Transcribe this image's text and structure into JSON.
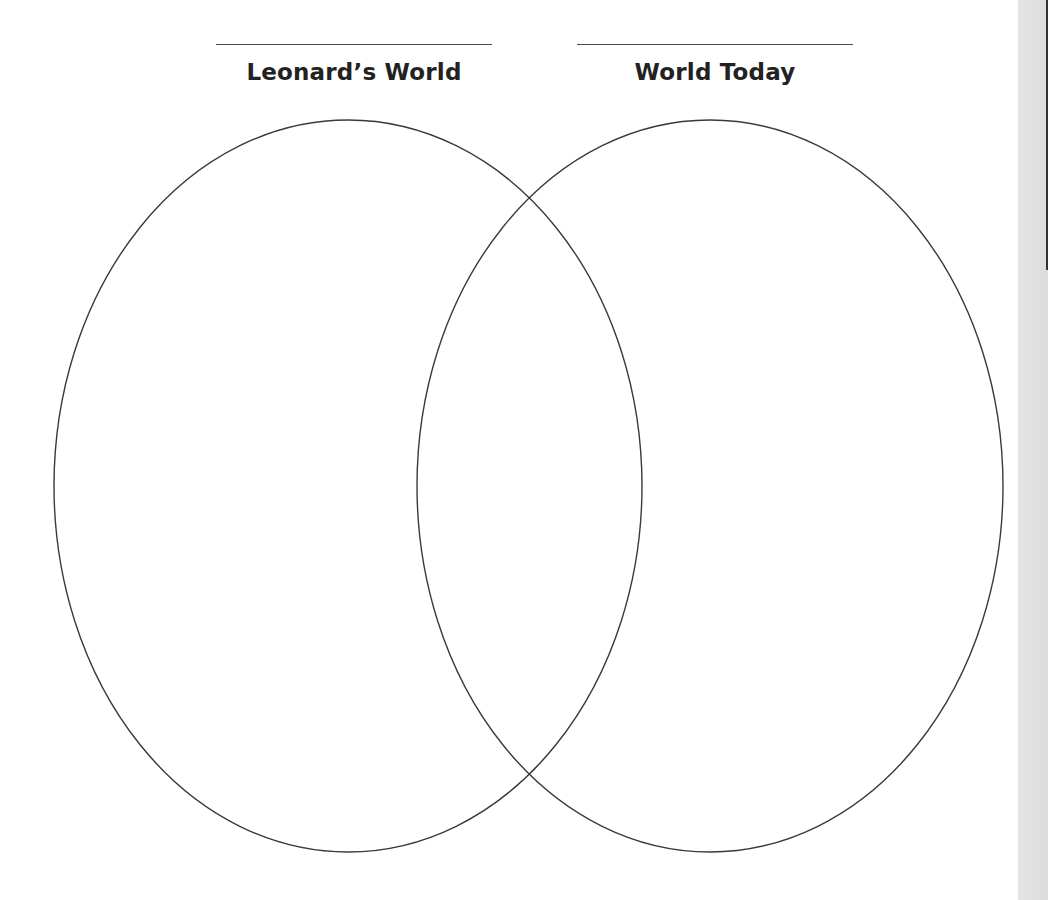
{
  "diagram": {
    "type": "venn",
    "sets": [
      {
        "label": "Leonard’s World",
        "answer_line": "",
        "ellipse": {
          "cx": 348,
          "cy": 486,
          "rx": 294,
          "ry": 366
        }
      },
      {
        "label": "World Today",
        "answer_line": "",
        "ellipse": {
          "cx": 710,
          "cy": 486,
          "rx": 293,
          "ry": 366
        }
      }
    ],
    "overlap_label": "",
    "stroke_color": "#3a3a3a",
    "text_color": "#222222"
  },
  "page_edge": {
    "strip_color": "#dedede",
    "bar_color": "#333333"
  }
}
